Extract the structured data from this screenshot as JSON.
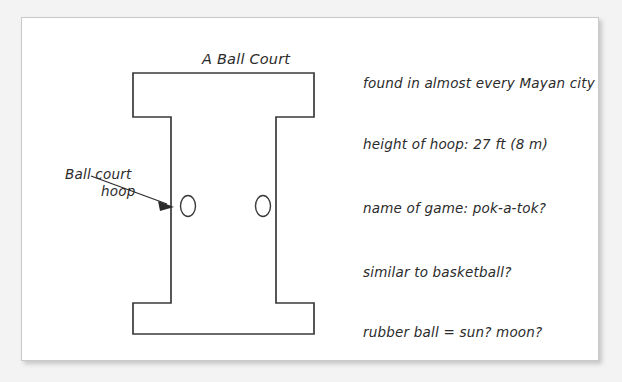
{
  "page": {
    "background_color": "#f3f3f3",
    "paper_color": "#ffffff",
    "ink_color": "#2b2b2b",
    "line_color": "#3a3a3a"
  },
  "diagram": {
    "title": "A Ball Court",
    "callout": {
      "label_line1": "Ball court",
      "label_line2": "hoop",
      "points_to": "left-hoop"
    },
    "court": {
      "shape": "I-shaped ball court plan",
      "hoops": [
        {
          "name": "left-hoop",
          "shape": "oval"
        },
        {
          "name": "right-hoop",
          "shape": "oval"
        }
      ]
    }
  },
  "notes": [
    "found in almost every Mayan city",
    "height of hoop: 27 ft (8 m)",
    "name of game: pok-a-tok?",
    "similar to basketball?",
    "rubber ball = sun? moon?"
  ]
}
